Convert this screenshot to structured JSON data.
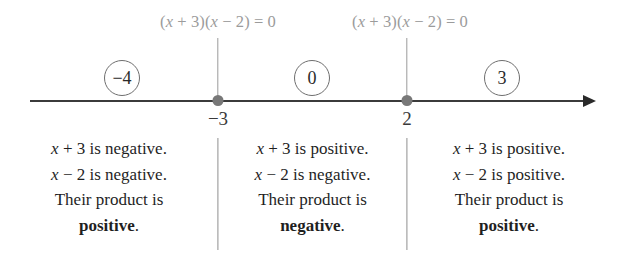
{
  "figure": {
    "type": "sign-chart-number-line",
    "title": "",
    "colors": {
      "axis": "#3b3b3b",
      "dot": "#787878",
      "label_gray": "#9b9b9b",
      "text": "#1f1f1f",
      "divider": "#8f8f8f",
      "background": "#ffffff"
    }
  },
  "top_labels": [
    {
      "id": "critical-point-label-left",
      "text": "(x + 3)(x − 2) = 0",
      "x": 218
    },
    {
      "id": "critical-point-label-right",
      "text": "(x + 3)(x − 2) = 0",
      "x": 410
    }
  ],
  "number_line": {
    "start_x": 30,
    "end_x": 590,
    "y": 100,
    "arrow_direction": "right",
    "critical_points": [
      {
        "label": "−3",
        "x": 218
      },
      {
        "label": "2",
        "x": 407
      }
    ],
    "test_values": [
      {
        "label": "−4",
        "x": 122
      },
      {
        "label": "0",
        "x": 312
      },
      {
        "label": "3",
        "x": 502
      }
    ]
  },
  "intervals": [
    {
      "id": "interval-left",
      "test_value": "−4",
      "factor_1": "x + 3 is negative.",
      "factor_2": "x − 2 is negative.",
      "conclusion_prefix": "Their product is",
      "verdict": "positive",
      "verdict_punctuation": "."
    },
    {
      "id": "interval-middle",
      "test_value": "0",
      "factor_1": "x + 3 is positive.",
      "factor_2": "x − 2 is negative.",
      "conclusion_prefix": "Their product is",
      "verdict": "negative",
      "verdict_punctuation": "."
    },
    {
      "id": "interval-right",
      "test_value": "3",
      "factor_1": "x + 3 is positive.",
      "factor_2": "x − 2 is positive.",
      "conclusion_prefix": "Their product is",
      "verdict": "positive",
      "verdict_punctuation": "."
    }
  ],
  "dividers": [
    {
      "id": "divider-left",
      "x": 218
    },
    {
      "id": "divider-right",
      "x": 407
    }
  ]
}
